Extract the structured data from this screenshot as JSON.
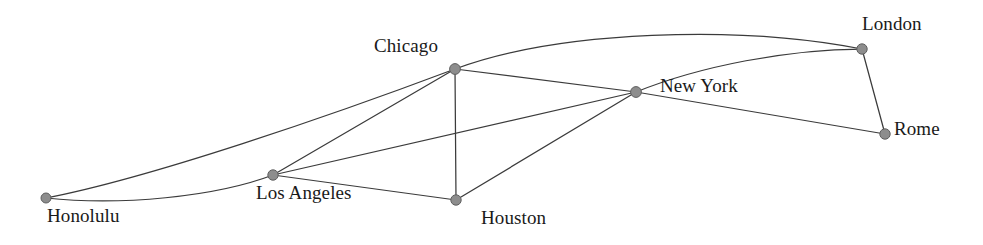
{
  "figure": {
    "kind": "node-link-network-diagram",
    "width": 983,
    "height": 245,
    "background_color": "#ffffff",
    "node_fill_color": "#8d8d8d",
    "node_stroke_color": "#5f5f5f",
    "edge_color": "#3b3b3b",
    "label_color": "#1a1a1a"
  },
  "chart_data": {
    "type": "graph",
    "title": "",
    "xlabel": "",
    "ylabel": "",
    "directed": false,
    "weighted": false,
    "node_count": 7,
    "edge_count": 12,
    "nodes": [
      {
        "id": "honolulu",
        "label": "Honolulu",
        "x": 46,
        "y": 198,
        "r": 5.0,
        "label_x": 47,
        "label_y": 206,
        "label_anchor": "below-right"
      },
      {
        "id": "los_angeles",
        "label": "Los Angeles",
        "x": 273,
        "y": 175,
        "r": 5.2,
        "label_x": 256,
        "label_y": 183,
        "label_anchor": "below"
      },
      {
        "id": "chicago",
        "label": "Chicago",
        "x": 455,
        "y": 69,
        "r": 5.4,
        "label_x": 374,
        "label_y": 36,
        "label_anchor": "above-left"
      },
      {
        "id": "houston",
        "label": "Houston",
        "x": 456,
        "y": 200,
        "r": 5.2,
        "label_x": 481,
        "label_y": 208,
        "label_anchor": "below-right"
      },
      {
        "id": "new_york",
        "label": "New York",
        "x": 636,
        "y": 92,
        "r": 5.4,
        "label_x": 660,
        "label_y": 76,
        "label_anchor": "right"
      },
      {
        "id": "london",
        "label": "London",
        "x": 862,
        "y": 49,
        "r": 5.2,
        "label_x": 862,
        "label_y": 14,
        "label_anchor": "above-right"
      },
      {
        "id": "rome",
        "label": "Rome",
        "x": 885,
        "y": 134,
        "r": 5.2,
        "label_x": 894,
        "label_y": 119,
        "label_anchor": "right"
      }
    ],
    "edges": [
      {
        "source": "honolulu",
        "target": "chicago",
        "shape": "curve",
        "path": "M 46 198 C 150 178 330 116 455 69"
      },
      {
        "source": "honolulu",
        "target": "los_angeles",
        "shape": "curve",
        "path": "M 46 198 C 120 206 215 197 273 175"
      },
      {
        "source": "los_angeles",
        "target": "chicago",
        "shape": "line",
        "path": "M 273 175 L 455 69"
      },
      {
        "source": "los_angeles",
        "target": "houston",
        "shape": "line",
        "path": "M 273 175 L 456 200"
      },
      {
        "source": "los_angeles",
        "target": "new_york",
        "shape": "line",
        "path": "M 273 175 L 636 92"
      },
      {
        "source": "chicago",
        "target": "houston",
        "shape": "line",
        "path": "M 455 69 L 456 200"
      },
      {
        "source": "chicago",
        "target": "new_york",
        "shape": "line",
        "path": "M 455 69 L 636 92"
      },
      {
        "source": "chicago",
        "target": "london",
        "shape": "curve",
        "path": "M 455 69 C 560 30 740 25 862 49"
      },
      {
        "source": "houston",
        "target": "new_york",
        "shape": "line",
        "path": "M 456 200 L 636 92"
      },
      {
        "source": "new_york",
        "target": "london",
        "shape": "curve",
        "path": "M 636 92 C 700 66 790 49 862 49"
      },
      {
        "source": "new_york",
        "target": "rome",
        "shape": "line",
        "path": "M 636 92 L 885 134"
      },
      {
        "source": "london",
        "target": "rome",
        "shape": "line",
        "path": "M 862 49 L 885 134"
      }
    ]
  }
}
